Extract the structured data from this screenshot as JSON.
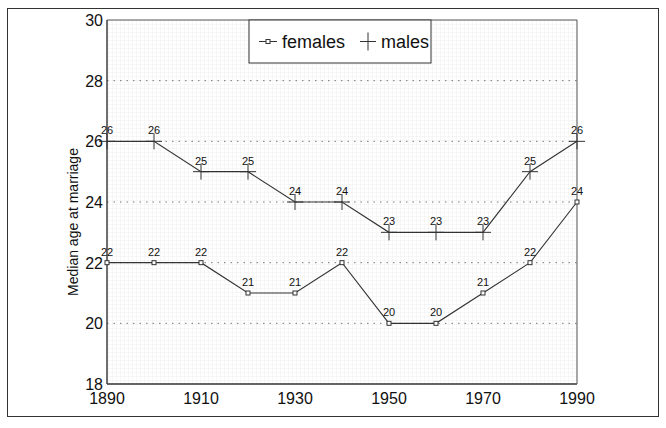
{
  "chart_data": {
    "type": "line",
    "title": "",
    "xlabel": "",
    "ylabel": "Median age at marriage",
    "x": [
      1890,
      1900,
      1910,
      1920,
      1930,
      1940,
      1950,
      1960,
      1970,
      1980,
      1990
    ],
    "xlim": [
      1890,
      1990
    ],
    "ylim": [
      18,
      30
    ],
    "xticks": [
      1890,
      1910,
      1930,
      1950,
      1970,
      1990
    ],
    "yticks": [
      18,
      20,
      22,
      24,
      26,
      28,
      30
    ],
    "grid": true,
    "legend_position": "top-center",
    "series": [
      {
        "name": "females",
        "marker": "square",
        "values": [
          22,
          22,
          22,
          21,
          21,
          22,
          20,
          20,
          21,
          22,
          24
        ]
      },
      {
        "name": "males",
        "marker": "plus",
        "values": [
          26,
          26,
          25,
          25,
          24,
          24,
          23,
          23,
          23,
          25,
          26
        ]
      }
    ]
  },
  "colors": {
    "line": "#333333",
    "grid": "#999999",
    "text": "#111111"
  }
}
